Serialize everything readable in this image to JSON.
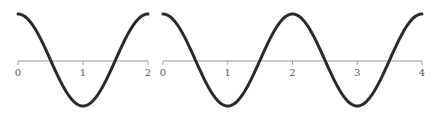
{
  "chart_data": [
    {
      "type": "line",
      "title": "",
      "xlabel": "",
      "ylabel": "",
      "function": "cos(pi*x)",
      "x_range": [
        0,
        2
      ],
      "ylim": [
        -1,
        1
      ],
      "grid": false,
      "x_ticks": [
        "0",
        "1",
        "2"
      ],
      "x": [
        0,
        0.25,
        0.5,
        0.75,
        1,
        1.25,
        1.5,
        1.75,
        2
      ],
      "values": [
        1,
        0.707,
        0,
        -0.707,
        -1,
        -0.707,
        0,
        0.707,
        1
      ],
      "line_color": "#2a2a2a",
      "axis_color": "#999999"
    },
    {
      "type": "line",
      "title": "",
      "xlabel": "",
      "ylabel": "",
      "function": "cos(pi*x)",
      "x_range": [
        0,
        4
      ],
      "ylim": [
        -1,
        1
      ],
      "grid": false,
      "x_ticks": [
        "0",
        "1",
        "2",
        "3",
        "4"
      ],
      "x": [
        0,
        0.5,
        1,
        1.5,
        2,
        2.5,
        3,
        3.5,
        4
      ],
      "values": [
        1,
        0,
        -1,
        0,
        1,
        0,
        -1,
        0,
        1
      ],
      "line_color": "#2a2a2a",
      "axis_color": "#999999"
    }
  ]
}
